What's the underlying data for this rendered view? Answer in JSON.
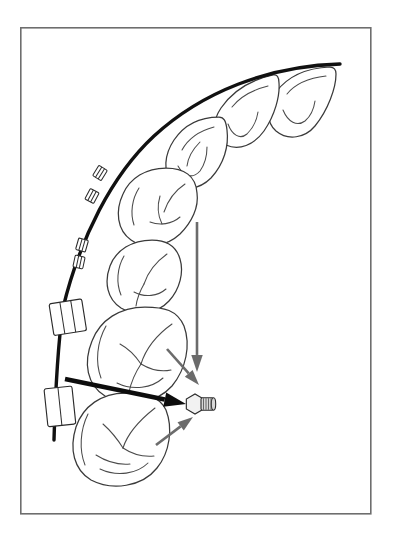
{
  "figure": {
    "kind": "line-drawing",
    "background_color": "#ffffff",
    "frame": {
      "color": "#6e6e6e",
      "x": 20,
      "y": 27,
      "width": 350,
      "height": 486
    }
  },
  "colors": {
    "archwire": "#111111",
    "tooth_outline": "#3a3a3a",
    "tooth_detail": "#4a4a4a",
    "gray_arrow": "#6b6b6b",
    "black_arrow": "#0d0d0d",
    "bracket": "#2b2b2b",
    "screw_body": "#d8d8d8",
    "screw_head": "#f2f2f2"
  },
  "archwire": {
    "label": "archwire",
    "stroke_width": 3.4,
    "path": "M 340 64 C 268 66 202 92 154 136 C 112 175 80 238 63 308 C 57 352 55 404 54 440"
  },
  "teeth": [
    {
      "name": "central-incisor",
      "position_index": 1,
      "outline": "M 330 67 C 306 68 288 76 276 92 C 266 106 266 122 276 131 C 288 141 305 138 315 126 C 328 110 336 88 336 74 C 336 69 334 67 330 67 Z",
      "details": [
        "M 326 76 C 309 78 295 84 287 94",
        "M 283 110 C 288 122 297 127 305 121 C 311 116 314 108 315 101"
      ]
    },
    {
      "name": "lateral-incisor",
      "position_index": 2,
      "outline": "M 273 75 C 250 80 232 92 221 108 C 211 123 213 138 226 145 C 239 151 254 145 264 131 C 275 115 280 96 279 83 C 279 77 277 74 273 75 Z",
      "details": [
        "M 268 86 C 252 90 240 97 232 107",
        "M 228 124 C 232 135 240 140 247 134 C 253 128 257 119 258 112"
      ]
    },
    {
      "name": "canine",
      "position_index": 3,
      "outline": "M 219 117 C 200 117 184 125 174 140 C 164 155 163 172 172 182 C 182 192 199 190 211 178 C 224 164 229 146 227 130 C 226 121 224 117 219 117 Z",
      "details": [
        "M 214 127 C 199 131 188 139 182 150",
        "M 178 166 C 184 177 193 179 200 171 C 205 164 207 155 207 147",
        "M 200 142 C 193 149 188 158 187 166"
      ]
    },
    {
      "name": "first-premolar",
      "position_index": 4,
      "outline": "M 166 168 C 146 168 130 178 123 194 C 115 211 117 230 131 240 C 145 250 166 247 180 234 C 192 222 199 207 197 193 C 196 176 184 168 166 168 Z",
      "details": [
        "M 185 184 C 176 190 168 200 164 212",
        "M 139 188 C 132 199 130 213 134 225",
        "M 150 222 C 160 226 172 224 180 217",
        "M 160 196 C 157 206 158 216 162 224"
      ]
    },
    {
      "name": "second-premolar",
      "position_index": 5,
      "outline": "M 152 240 C 132 240 116 250 110 266 C 104 282 107 299 121 308 C 136 317 157 314 169 301 C 180 289 184 272 180 259 C 176 245 166 240 152 240 Z",
      "details": [
        "M 167 254 C 157 261 148 272 144 284",
        "M 124 256 C 117 268 116 283 121 295",
        "M 134 292 C 145 298 158 296 166 289",
        "M 144 284 C 140 291 137 299 136 306"
      ]
    },
    {
      "name": "first-molar",
      "position_index": 6,
      "outline": "M 145 307 C 120 307 100 320 92 341 C 83 363 87 385 105 396 C 126 408 156 404 172 386 C 186 369 191 345 184 326 C 177 310 164 307 145 307 Z",
      "details": [
        "M 172 324 C 158 334 146 348 141 364",
        "M 106 326 C 97 342 95 362 101 378",
        "M 117 383 C 133 391 152 388 163 378",
        "M 141 364 C 135 373 131 383 129 392",
        "M 141 364 C 151 370 162 372 171 370",
        "M 120 344 C 131 350 137 358 141 364"
      ]
    },
    {
      "name": "second-molar",
      "position_index": 7,
      "outline": "M 125 393 C 102 393 83 406 76 427 C 69 449 74 470 91 480 C 112 491 142 487 157 468 C 170 452 173 428 166 410 C 159 395 143 393 125 393 Z",
      "details": [
        "M 155 408 C 141 419 128 432 123 448",
        "M 88 414 C 80 430 79 450 85 465",
        "M 100 469 C 117 477 137 474 148 463",
        "M 123 448 C 132 454 144 457 154 456",
        "M 103 424 C 112 432 118 440 123 448",
        "M 96 455 C 107 462 119 465 130 464"
      ]
    }
  ],
  "brackets": [
    {
      "name": "bracket-canine",
      "x": 100,
      "y": 173,
      "angle": -58
    },
    {
      "name": "bracket-first-premolar",
      "x": 92,
      "y": 196,
      "angle": -62
    },
    {
      "name": "bracket-second-premolar",
      "x": 82,
      "y": 245,
      "angle": -74
    },
    {
      "name": "bracket-lower",
      "x": 79,
      "y": 262,
      "angle": -78
    }
  ],
  "tubes": [
    {
      "name": "molar-tube-first-molar",
      "label": "buccal tube",
      "x": 49,
      "y": 304,
      "width": 33,
      "height": 32,
      "angle": -9,
      "slots": 3
    },
    {
      "name": "molar-tube-second-molar",
      "label": "buccal tube with hook",
      "x": 44,
      "y": 389,
      "width": 28,
      "height": 38,
      "angle": -6,
      "slots": 2
    }
  ],
  "mini_implant": {
    "name": "mini-implant-screw",
    "label": "mini-implant / temporary anchorage device",
    "cx": 198,
    "cy": 404,
    "head_radius": 10,
    "thread_turns": 4
  },
  "force_arrows": [
    {
      "name": "force-arrow-vertical",
      "style": "gray",
      "label": "intrusive vertical force",
      "from": {
        "x": 197,
        "y": 222
      },
      "to": {
        "x": 197,
        "y": 372
      },
      "head_size": 11
    },
    {
      "name": "force-arrow-upper-diagonal",
      "style": "gray",
      "label": "distal force from first molar",
      "from": {
        "x": 167,
        "y": 349
      },
      "to": {
        "x": 199,
        "y": 385
      },
      "head_size": 10
    },
    {
      "name": "force-arrow-lower-diagonal",
      "style": "gray",
      "label": "distal force from second molar",
      "from": {
        "x": 156,
        "y": 445
      },
      "to": {
        "x": 193,
        "y": 417
      },
      "head_size": 10
    },
    {
      "name": "force-arrow-horizontal",
      "style": "black",
      "label": "resultant retraction force along archwire",
      "from": {
        "x": 65,
        "y": 379
      },
      "to": {
        "x": 186,
        "y": 404
      },
      "head_size": 14
    }
  ]
}
